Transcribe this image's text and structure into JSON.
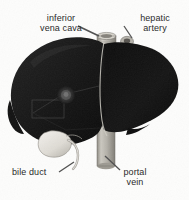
{
  "figure": {
    "view": "anterior-oblique",
    "background_color": "#fdfdfc"
  },
  "labels": [
    {
      "id": "inferior-vena-cava",
      "text": "inferior\nvena cava",
      "lines": [
        "inferior",
        "vena cava"
      ],
      "align": "center",
      "leader": "down-right",
      "points_to": "inferior-vena-cava-stump"
    },
    {
      "id": "hepatic-artery",
      "text": "hepatic\nartery",
      "lines": [
        "hepatic",
        "artery"
      ],
      "align": "center",
      "leader": "down-left",
      "points_to": "hepatic-artery-stump"
    },
    {
      "id": "bile-duct",
      "text": "bile duct",
      "lines": [
        "bile duct"
      ],
      "align": "left",
      "leader": "up-right",
      "points_to": "bile-duct-tube"
    },
    {
      "id": "portal-vein",
      "text": "portal\nvein",
      "lines": [
        "portal",
        "vein"
      ],
      "align": "center",
      "leader": "up-left",
      "points_to": "portal-vein-cylinder"
    }
  ],
  "structures": [
    {
      "id": "liver-body",
      "name": "liver",
      "color": "#151515",
      "description": "large dark liver mass with right and left lobes"
    },
    {
      "id": "right-lobe",
      "name": "right lobe of liver",
      "color": "#101010"
    },
    {
      "id": "left-lobe",
      "name": "left lobe of liver",
      "color": "#1a1a1a"
    },
    {
      "id": "inferior-vena-cava-stump",
      "name": "inferior vena cava",
      "color": "#b9b6ae",
      "shape": "short vertical cylinder stump at superior surface"
    },
    {
      "id": "hepatic-artery-stump",
      "name": "hepatic artery",
      "color": "#b0ada5",
      "shape": "small round cut vessel"
    },
    {
      "id": "portal-vein-cylinder",
      "name": "portal vein",
      "color": "#b5b2aa",
      "shape": "vertical cylinder below liver"
    },
    {
      "id": "gallbladder",
      "name": "gallbladder",
      "color": "#e8e6e0",
      "shape": "pear-shaped sac on inferior surface"
    },
    {
      "id": "bile-duct-tube",
      "name": "bile duct",
      "color": "#ddd9d2",
      "shape": "thin curved tube from gallbladder neck"
    },
    {
      "id": "porta-hepatis",
      "name": "porta hepatis",
      "color": "#4a4a4a",
      "shape": "lighter circular hilum region"
    },
    {
      "id": "falciform-ligament",
      "name": "falciform ligament fissure",
      "color": "#3a3a3a",
      "shape": "faint dividing line between lobes"
    }
  ],
  "colors": {
    "liver_dark": "#151515",
    "liver_mid": "#1f1f1f",
    "vessel_gray": "#b5b2aa",
    "gallbladder_light": "#e8e6e0",
    "text": "#2b2b2b",
    "leader_line": "#555555"
  }
}
